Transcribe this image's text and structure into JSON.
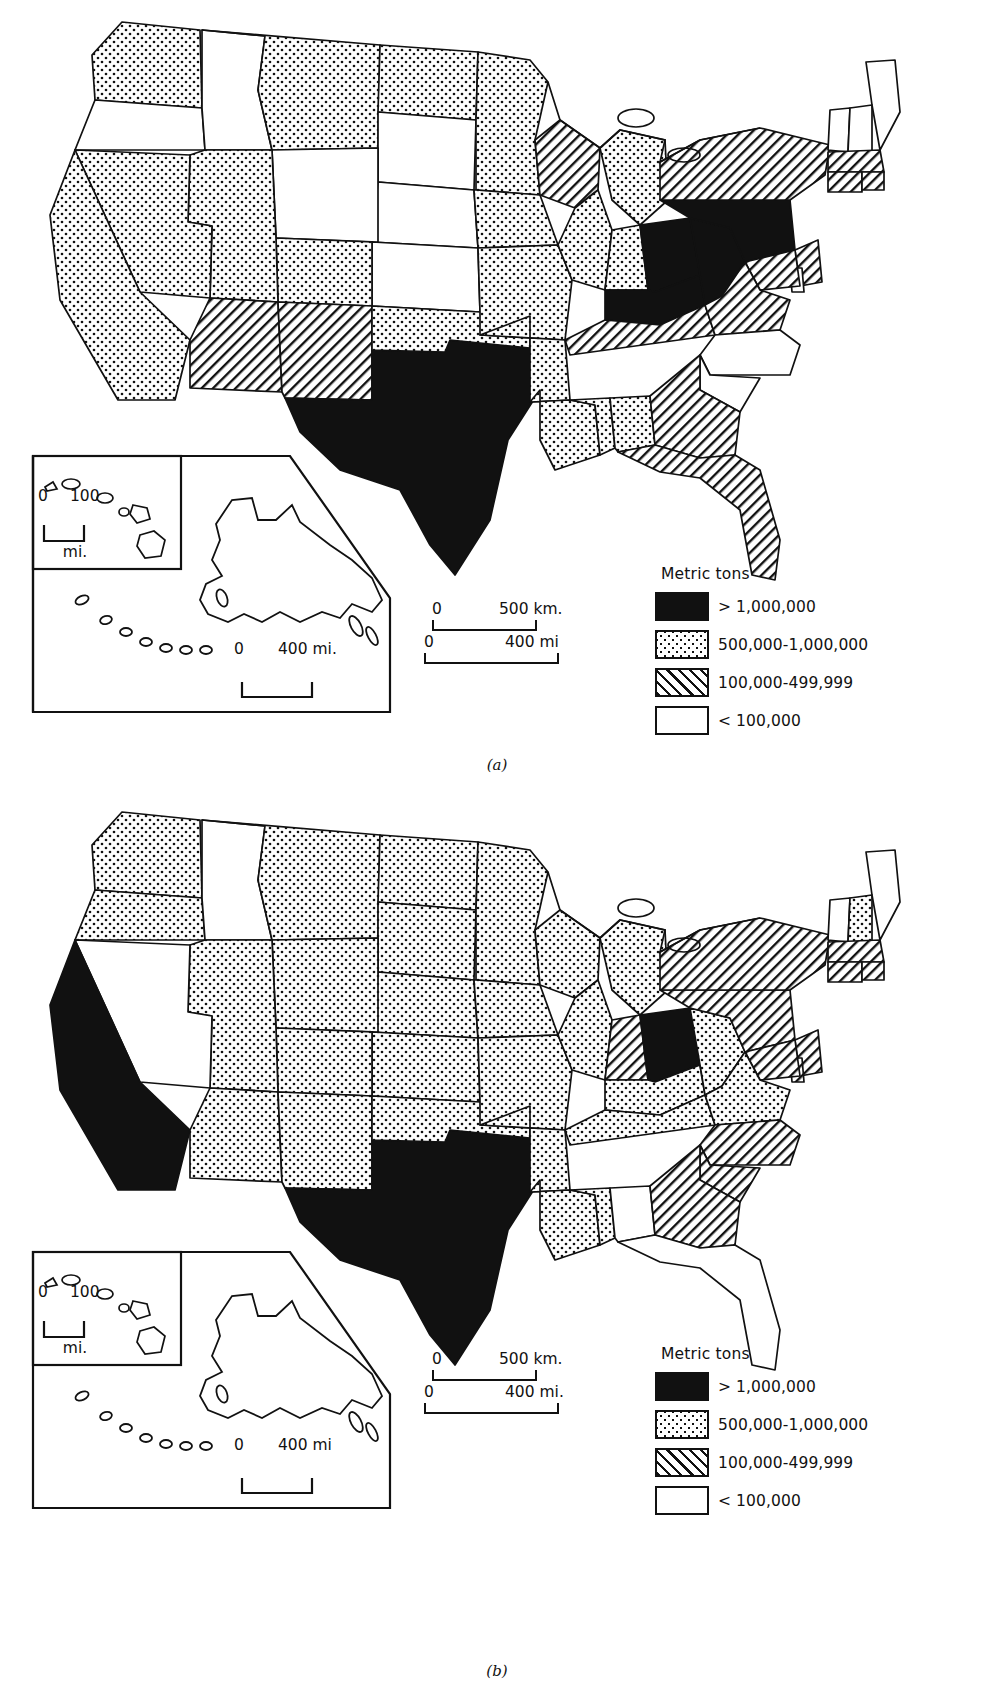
{
  "figure": {
    "panels": [
      {
        "id": "a",
        "caption": "(a)",
        "legend": {
          "title": "Metric tons",
          "entries": [
            {
              "pattern": "solid",
              "label": "> 1,000,000"
            },
            {
              "pattern": "dots",
              "label": "500,000-1,000,000"
            },
            {
              "pattern": "hatch",
              "label": "100,000-499,999"
            },
            {
              "pattern": "blank",
              "label": "< 100,000"
            }
          ]
        },
        "scalebars": [
          {
            "name": "km-scale",
            "zero": "0",
            "max": "500 km."
          },
          {
            "name": "mi-scale",
            "zero": "0",
            "max": "400 mi"
          }
        ],
        "insets": {
          "hawaii": {
            "zero": "0",
            "max": "100",
            "caption": "mi."
          },
          "alaska": {
            "zero": "0",
            "max": "400 mi."
          }
        },
        "state_classes": {
          "solid": [
            "Texas",
            "Pennsylvania",
            "Ohio",
            "West Virginia",
            "Kentucky"
          ],
          "dots": [
            "Washington",
            "Montana",
            "California",
            "Nevada",
            "Utah",
            "Colorado",
            "North Dakota",
            "Minnesota",
            "Iowa",
            "Missouri",
            "Arkansas",
            "Louisiana",
            "Mississippi",
            "Alabama",
            "Oklahoma",
            "Indiana",
            "Illinois",
            "Michigan"
          ],
          "hatch": [
            "Arizona",
            "New Mexico",
            "Wisconsin",
            "Tennessee",
            "Georgia",
            "Florida",
            "Virginia",
            "New York",
            "New Jersey",
            "Maryland",
            "Massachusetts",
            "Connecticut",
            "Rhode Island"
          ],
          "blank": [
            "Oregon",
            "Idaho",
            "Wyoming",
            "Nebraska",
            "Kansas",
            "South Dakota",
            "North Carolina",
            "South Carolina",
            "Maine",
            "New Hampshire",
            "Vermont",
            "Delaware"
          ]
        }
      },
      {
        "id": "b",
        "caption": "(b)",
        "legend": {
          "title": "Metric tons",
          "entries": [
            {
              "pattern": "solid",
              "label": "> 1,000,000"
            },
            {
              "pattern": "dots",
              "label": "500,000-1,000,000"
            },
            {
              "pattern": "hatch",
              "label": "100,000-499,999"
            },
            {
              "pattern": "blank",
              "label": "< 100,000"
            }
          ]
        },
        "scalebars": [
          {
            "name": "km-scale",
            "zero": "0",
            "max": "500 km."
          },
          {
            "name": "mi-scale",
            "zero": "0",
            "max": "400 mi."
          }
        ],
        "insets": {
          "hawaii": {
            "zero": "0",
            "max": "100",
            "caption": "mi."
          },
          "alaska": {
            "zero": "0",
            "max": "400 mi"
          }
        },
        "state_classes": {
          "solid": [
            "California",
            "Texas",
            "Ohio"
          ],
          "dots": [
            "Washington",
            "Oregon",
            "Montana",
            "Wyoming",
            "Utah",
            "Arizona",
            "New Mexico",
            "Colorado",
            "North Dakota",
            "South Dakota",
            "Nebraska",
            "Kansas",
            "Oklahoma",
            "Minnesota",
            "Iowa",
            "Missouri",
            "Arkansas",
            "Louisiana",
            "Mississippi",
            "Wisconsin",
            "Illinois",
            "Michigan",
            "Kentucky",
            "Tennessee",
            "West Virginia",
            "Virginia",
            "New Hampshire"
          ],
          "hatch": [
            "Indiana",
            "Pennsylvania",
            "New York",
            "New Jersey",
            "Maryland",
            "Delaware",
            "Connecticut",
            "Rhode Island",
            "Massachusetts",
            "North Carolina",
            "South Carolina",
            "Georgia",
            "Florida",
            "Alabama"
          ],
          "blank": [
            "Idaho",
            "Nevada",
            "Maine",
            "Vermont"
          ]
        }
      }
    ]
  }
}
